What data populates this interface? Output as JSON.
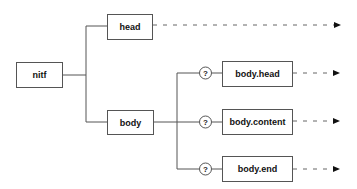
{
  "diagram": {
    "type": "tree",
    "root": {
      "label": "nitf"
    },
    "children": [
      {
        "label": "head",
        "continues": true
      },
      {
        "label": "body",
        "children": [
          {
            "label": "body.head",
            "cardinality": "?",
            "continues": true
          },
          {
            "label": "body.content",
            "cardinality": "?",
            "continues": true
          },
          {
            "label": "body.end",
            "cardinality": "?",
            "continues": true
          }
        ]
      }
    ],
    "colors": {
      "line": "#555555",
      "text": "#111111",
      "background": "#ffffff"
    }
  }
}
